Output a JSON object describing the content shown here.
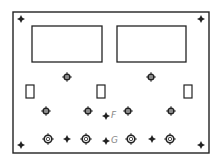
{
  "diagram": {
    "type": "panel-layout",
    "stroke_color": "#222222",
    "label_color": "#888888",
    "outer_panel": {
      "x": 13,
      "y": 12,
      "w": 196,
      "h": 141
    },
    "corner_markers": [
      {
        "x": 21,
        "y": 19
      },
      {
        "x": 201,
        "y": 19
      },
      {
        "x": 21,
        "y": 145
      },
      {
        "x": 201,
        "y": 145
      }
    ],
    "displays": [
      {
        "name": "left-display",
        "x": 32,
        "y": 26,
        "w": 70,
        "h": 36
      },
      {
        "name": "right-display",
        "x": 117,
        "y": 26,
        "w": 69,
        "h": 36
      }
    ],
    "switches": [
      {
        "x": 26,
        "y": 85,
        "w": 8,
        "h": 13
      },
      {
        "x": 97,
        "y": 85,
        "w": 8,
        "h": 13
      },
      {
        "x": 184,
        "y": 85,
        "w": 8,
        "h": 13
      }
    ],
    "small_knobs": [
      {
        "x": 67,
        "y": 77
      },
      {
        "x": 151,
        "y": 77
      },
      {
        "x": 46,
        "y": 111
      },
      {
        "x": 88,
        "y": 111
      },
      {
        "x": 128,
        "y": 111
      },
      {
        "x": 171,
        "y": 111
      }
    ],
    "large_knobs": [
      {
        "x": 48,
        "y": 139
      },
      {
        "x": 86,
        "y": 139
      },
      {
        "x": 131,
        "y": 139
      },
      {
        "x": 170,
        "y": 139
      }
    ],
    "dots": [
      {
        "x": 67,
        "y": 139
      },
      {
        "x": 152,
        "y": 139
      }
    ],
    "labeled_points": [
      {
        "label": "F",
        "x": 106,
        "y": 116
      },
      {
        "label": "G",
        "x": 106,
        "y": 141
      }
    ]
  }
}
